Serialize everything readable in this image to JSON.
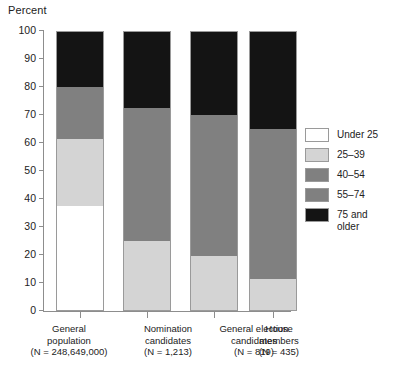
{
  "chart_data": {
    "type": "bar",
    "subtype": "stacked-bar-100pct",
    "title": "",
    "ylabel": "Percent",
    "xlabel": "",
    "ylim": [
      0,
      100
    ],
    "yticks": [
      0,
      10,
      20,
      30,
      40,
      50,
      60,
      70,
      80,
      90,
      100
    ],
    "ytick_labels": [
      "0",
      "10",
      "20",
      "30",
      "40",
      "50",
      "60",
      "70",
      "80",
      "90",
      "100"
    ],
    "grid": false,
    "legend_position": "right",
    "categories": [
      "General population",
      "Nomination candidates",
      "General election candidates",
      "House members"
    ],
    "category_notes": [
      "(N = 248,649,000)",
      "(N = 1,213)",
      "(N = 819)",
      "(N = 435)"
    ],
    "series": [
      {
        "name": "Under 25",
        "color": "#ffffff",
        "values": [
          37.5,
          0,
          0,
          0
        ]
      },
      {
        "name": "25–39",
        "color": "#d4d4d4",
        "values": [
          24.0,
          25.0,
          19.5,
          11.5
        ]
      },
      {
        "name": "40–54",
        "color": "#808080",
        "values": [
          12.0,
          28.0,
          30.0,
          30.0
        ]
      },
      {
        "name": "55–74",
        "color": "#808080",
        "values": [
          6.5,
          19.5,
          20.5,
          23.5
        ]
      },
      {
        "name": "75 and\nolder",
        "color": "#141414",
        "values": [
          20.0,
          27.5,
          30.0,
          35.0
        ]
      }
    ],
    "stack_boundaries": [
      [
        0,
        37.5,
        61.5,
        73.5,
        80.0,
        100
      ],
      [
        0,
        0,
        25.0,
        53.0,
        72.5,
        100
      ],
      [
        0,
        0,
        19.5,
        49.5,
        70.0,
        100
      ],
      [
        0,
        0,
        11.5,
        41.5,
        65.0,
        100
      ]
    ]
  },
  "axis": {
    "y_title": "Percent"
  },
  "legend": {
    "items": [
      {
        "label": "Under 25"
      },
      {
        "label": "25–39"
      },
      {
        "label": "40–54"
      },
      {
        "label": "55–74"
      },
      {
        "label": "75 and\nolder"
      }
    ]
  },
  "categories": [
    {
      "line1": "General",
      "line2": "population",
      "n": "(N = 248,649,000)"
    },
    {
      "line1": "Nomination",
      "line2": "candidates",
      "n": "(N = 1,213)"
    },
    {
      "line1": "General election",
      "line2": "candidates",
      "n": "(N = 819)"
    },
    {
      "line1": "House",
      "line2": "members",
      "n": "(N = 435)"
    }
  ]
}
